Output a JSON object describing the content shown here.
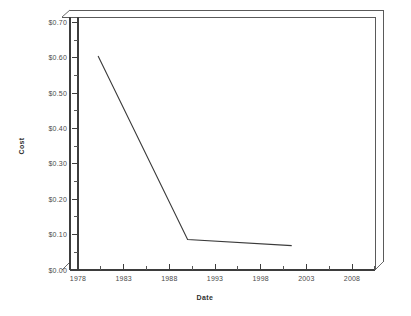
{
  "chart_data": {
    "type": "line",
    "title": "",
    "xlabel": "Date",
    "ylabel": "Cost",
    "xlim": [
      1978,
      2011
    ],
    "ylim": [
      0.0,
      0.715
    ],
    "grid": false,
    "legend": null,
    "x_tick_labels": [
      "1978",
      "1983",
      "1988",
      "1993",
      "1998",
      "2003",
      "2008"
    ],
    "x_tick_values": [
      1978,
      1983,
      1988,
      1993,
      1998,
      2003,
      2008
    ],
    "x_minor_interval": 2.5,
    "y_tick_labels": [
      "$0.00",
      "$0.10",
      "$0.20",
      "$0.30",
      "$0.40",
      "$0.50",
      "$0.60",
      "$0.70"
    ],
    "y_tick_values": [
      0.0,
      0.1,
      0.2,
      0.3,
      0.4,
      0.5,
      0.6,
      0.7
    ],
    "y_minor_interval": 0.05,
    "series": [
      {
        "name": "Cost",
        "color": "#3a3a3a",
        "x": [
          1980.2,
          1990.0,
          2001.4
        ],
        "values": [
          0.605,
          0.086,
          0.069
        ]
      }
    ]
  },
  "axes": {
    "y_title": "Cost",
    "x_title": "Date"
  },
  "style": {
    "line_color": "#3a3a3a",
    "frame_color": "#5a5a5a",
    "text_color": "#4a4a4a",
    "background": "#ffffff"
  }
}
